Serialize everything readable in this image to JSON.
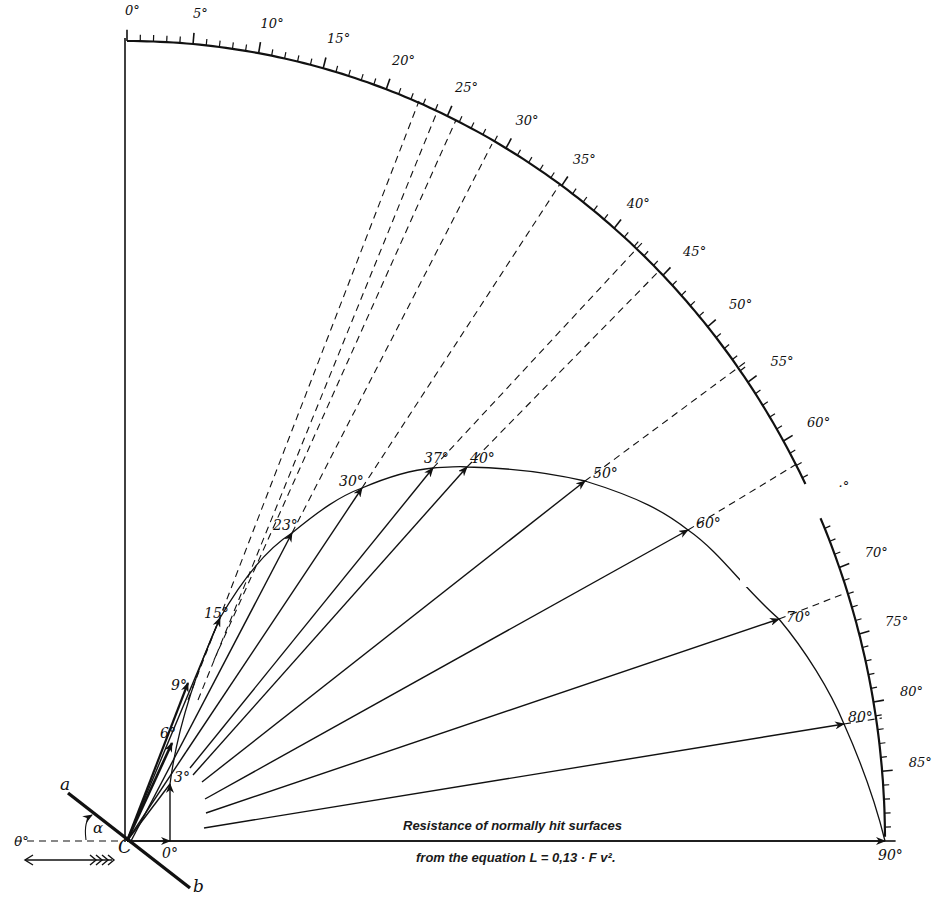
{
  "diagram": {
    "title_line_1": "Resistance of normally hit surfaces",
    "title_line_2": "from the equation L = 0,13 · F v².",
    "colors": {
      "ink": "#111111",
      "background": "#ffffff"
    },
    "origin_label": "C",
    "plate_end_labels": {
      "a": "a",
      "b": "b"
    },
    "incidence_angle_label": "α",
    "reference_axis_label": "0°",
    "flow_direction": "left (feathered arrow)",
    "outer_scale": {
      "description": "Quadrant scale from 0° (vertical) to 90° (horizontal), tick every 1°, labeled every 5°",
      "labels": [
        "0°",
        "5°",
        "10°",
        "15°",
        "20°",
        "25°",
        "30°",
        "35°",
        "40°",
        "45°",
        "50°",
        "55°",
        "60°",
        "65°",
        "70°",
        "75°",
        "80°",
        "85°",
        "90°"
      ],
      "label_65_rendered": "·°"
    },
    "polar_curve": {
      "description": "Resultant force vectors for inclined plate at angle of attack α; arrow tips trace the polar curve",
      "arrow_labels": [
        "0°",
        "3°",
        "6°",
        "9°",
        "15°",
        "23°",
        "30°",
        "37°",
        "40°",
        "50°",
        "60°",
        "70°",
        "80°",
        "90°"
      ]
    }
  },
  "chart_data": {
    "type": "scatter",
    "xlabel": "",
    "ylabel": "",
    "coordinate_system": "polar quadrant, angle measured from vertical (0°) to horizontal (90°)",
    "series": [
      {
        "name": "Resultant force vector tip (angle of attack α)",
        "alpha_deg": [
          0,
          3,
          6,
          9,
          15,
          23,
          30,
          37,
          40,
          50,
          60,
          70,
          80,
          90
        ],
        "approx_direction_on_scale_deg": [
          90,
          90,
          22,
          22,
          22,
          24,
          29,
          37,
          43,
          47,
          55,
          66,
          76,
          90
        ],
        "approx_relative_magnitude": [
          0.06,
          0.07,
          0.13,
          0.21,
          0.3,
          0.42,
          0.5,
          0.56,
          0.58,
          0.64,
          0.72,
          0.8,
          0.94,
          1.0
        ]
      }
    ],
    "scale_ticks_deg": [
      0,
      5,
      10,
      15,
      20,
      25,
      30,
      35,
      40,
      45,
      50,
      55,
      60,
      65,
      70,
      75,
      80,
      85,
      90
    ],
    "grid": false,
    "legend": "none"
  }
}
